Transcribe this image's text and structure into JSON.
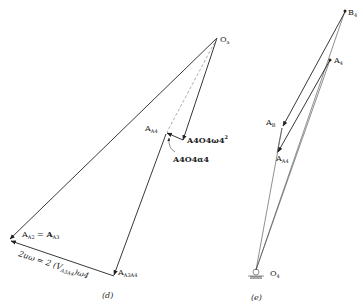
{
  "figure_d": {
    "caption": "(d)",
    "labels": {
      "origin": "O",
      "origin_sub": "a",
      "a_a4": "A",
      "a_a4_sub": "A4",
      "a_a2": "A",
      "a_a2_sub": "A2",
      "equals": " = ",
      "a_a3": "A",
      "a_a3_sub": "A3",
      "a_a3a4": "A",
      "a_a3a4_sub": "A3A4",
      "normal_term": "A4O4ω4",
      "normal_term_sup": "2",
      "tangential_term": "A4O4α4",
      "coriolis": "2uω = 2 (V",
      "coriolis_sub": "A3A4",
      "coriolis_end": ")ω4"
    }
  },
  "figure_e": {
    "caption": "(e)",
    "labels": {
      "b4": "B",
      "b4_sub": "4",
      "a4": "A",
      "a4_sub": "4",
      "ab": "A",
      "ab_sub": "B",
      "a_a4": "A",
      "a_a4_sub": "A4",
      "o4": "O",
      "o4_sub": "4"
    }
  }
}
